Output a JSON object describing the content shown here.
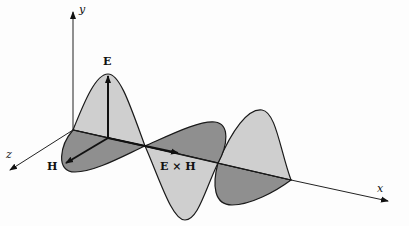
{
  "diagram": {
    "axes": {
      "x_label": "x",
      "y_label": "y",
      "z_label": "z"
    },
    "vectors": {
      "electric_label": "E",
      "magnetic_label": "H",
      "poynting_label": "E × H"
    },
    "colors": {
      "electric_fill": "#cfcfcf",
      "magnetic_fill": "#8f8f8f",
      "outline": "#1a1a1a",
      "background": "#fdfdfd"
    }
  }
}
